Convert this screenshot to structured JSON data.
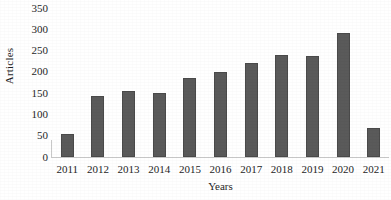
{
  "chart_data": {
    "type": "bar",
    "title": "",
    "xlabel": "Years",
    "ylabel": "Articles",
    "categories": [
      "2011",
      "2012",
      "2013",
      "2014",
      "2015",
      "2016",
      "2017",
      "2018",
      "2019",
      "2020",
      "2021"
    ],
    "values": [
      55,
      143,
      155,
      150,
      185,
      200,
      220,
      240,
      238,
      292,
      68
    ],
    "ylim": [
      0,
      350
    ],
    "yticks": [
      0,
      50,
      100,
      150,
      200,
      250,
      300,
      350
    ],
    "ytick_labels": [
      "0",
      "50",
      "100",
      "150",
      "200",
      "250",
      "300",
      "350"
    ],
    "grid": false,
    "legend": null,
    "bar_color": "#5a5a5a",
    "bar_outline_color": "#4a4a4a",
    "axis_color": "#c9c9c9",
    "text_color": "#1f1f1f",
    "background": "#ffffff"
  }
}
